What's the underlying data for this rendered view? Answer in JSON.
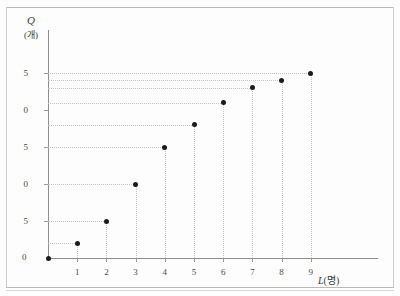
{
  "figure": {
    "origin_label": "0",
    "y_axis_title_symbol": "Q",
    "y_axis_title_unit": "(개)",
    "x_axis_title_symbol": "L",
    "x_axis_title_unit": "(명)"
  },
  "chart_data": {
    "type": "scatter",
    "title": "",
    "xlabel": "L(명)",
    "ylabel": "Q(개)",
    "x": [
      1,
      2,
      3,
      4,
      5,
      6,
      7,
      8,
      9
    ],
    "values": [
      2,
      5,
      10,
      15,
      18,
      21,
      23,
      24,
      25
    ],
    "points": [
      {
        "x": 1,
        "y": 2
      },
      {
        "x": 2,
        "y": 5
      },
      {
        "x": 3,
        "y": 10
      },
      {
        "x": 4,
        "y": 15
      },
      {
        "x": 5,
        "y": 18
      },
      {
        "x": 6,
        "y": 21
      },
      {
        "x": 7,
        "y": 23
      },
      {
        "x": 8,
        "y": 24
      },
      {
        "x": 9,
        "y": 25
      }
    ],
    "xlim": [
      0,
      9
    ],
    "ylim": [
      0,
      25
    ],
    "xticks": [
      0,
      1,
      2,
      3,
      4,
      5,
      6,
      7,
      8,
      9
    ],
    "xtick_labels": [
      "0",
      "1",
      "2",
      "3",
      "4",
      "5",
      "6",
      "7",
      "8",
      "9"
    ],
    "yticks": [
      0,
      5,
      10,
      15,
      20,
      25
    ],
    "ytick_labels": [
      "0",
      "5",
      "10",
      "15",
      "20",
      "25"
    ],
    "ytick_labels_visible": [
      "0",
      "5",
      "0",
      "5",
      "0",
      "5"
    ],
    "grid": "dotted leader lines from each point to both axes",
    "legend": "none",
    "marker_color": "#1b1b1b",
    "axis_color": "#8d8d8d",
    "grid_color": "#c2c2c2"
  }
}
